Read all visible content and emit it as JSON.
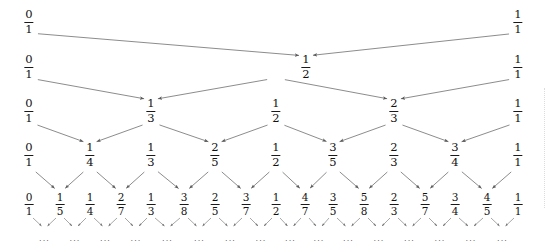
{
  "figure": {
    "width": 546,
    "height": 252,
    "background_color": "#ffffff",
    "text_color": "#111111",
    "arrow_color": "#555555"
  },
  "chart_data": {
    "type": "diagram",
    "subtype": "stern-brocot-mediant-tree",
    "rows": [
      {
        "level": 1,
        "y": 22,
        "fractions": [
          {
            "n": "0",
            "d": "1",
            "x": 29,
            "new": false
          },
          {
            "n": "1",
            "d": "1",
            "x": 518,
            "new": false
          }
        ]
      },
      {
        "level": 2,
        "y": 67,
        "fractions": [
          {
            "n": "0",
            "d": "1",
            "x": 29,
            "new": false
          },
          {
            "n": "1",
            "d": "2",
            "x": 306,
            "new": true
          },
          {
            "n": "1",
            "d": "1",
            "x": 518,
            "new": false
          }
        ]
      },
      {
        "level": 3,
        "y": 111,
        "fractions": [
          {
            "n": "0",
            "d": "1",
            "x": 29,
            "new": false
          },
          {
            "n": "1",
            "d": "3",
            "x": 151,
            "new": true
          },
          {
            "n": "1",
            "d": "2",
            "x": 276,
            "new": false
          },
          {
            "n": "2",
            "d": "3",
            "x": 394,
            "new": true
          },
          {
            "n": "1",
            "d": "1",
            "x": 518,
            "new": false
          }
        ]
      },
      {
        "level": 4,
        "y": 155,
        "fractions": [
          {
            "n": "0",
            "d": "1",
            "x": 29,
            "new": false
          },
          {
            "n": "1",
            "d": "4",
            "x": 90,
            "new": true
          },
          {
            "n": "1",
            "d": "3",
            "x": 151,
            "new": false
          },
          {
            "n": "2",
            "d": "5",
            "x": 215,
            "new": true
          },
          {
            "n": "1",
            "d": "2",
            "x": 276,
            "new": false
          },
          {
            "n": "3",
            "d": "5",
            "x": 333,
            "new": true
          },
          {
            "n": "2",
            "d": "3",
            "x": 394,
            "new": false
          },
          {
            "n": "3",
            "d": "4",
            "x": 455,
            "new": true
          },
          {
            "n": "1",
            "d": "1",
            "x": 518,
            "new": false
          }
        ]
      },
      {
        "level": 5,
        "y": 204,
        "fractions": [
          {
            "n": "0",
            "d": "1",
            "x": 29,
            "new": false
          },
          {
            "n": "1",
            "d": "5",
            "x": 60,
            "new": true
          },
          {
            "n": "1",
            "d": "4",
            "x": 90,
            "new": false
          },
          {
            "n": "2",
            "d": "7",
            "x": 121,
            "new": true
          },
          {
            "n": "1",
            "d": "3",
            "x": 151,
            "new": false
          },
          {
            "n": "3",
            "d": "8",
            "x": 184,
            "new": true
          },
          {
            "n": "2",
            "d": "5",
            "x": 215,
            "new": false
          },
          {
            "n": "3",
            "d": "7",
            "x": 246,
            "new": true
          },
          {
            "n": "1",
            "d": "2",
            "x": 276,
            "new": false
          },
          {
            "n": "4",
            "d": "7",
            "x": 305,
            "new": true
          },
          {
            "n": "3",
            "d": "5",
            "x": 333,
            "new": false
          },
          {
            "n": "5",
            "d": "8",
            "x": 364,
            "new": true
          },
          {
            "n": "2",
            "d": "3",
            "x": 394,
            "new": false
          },
          {
            "n": "5",
            "d": "7",
            "x": 425,
            "new": true
          },
          {
            "n": "3",
            "d": "4",
            "x": 455,
            "new": false
          },
          {
            "n": "4",
            "d": "5",
            "x": 487,
            "new": true
          },
          {
            "n": "1",
            "d": "1",
            "x": 518,
            "new": false
          }
        ]
      }
    ],
    "continuation": {
      "label": "...",
      "y": 232,
      "marker": "pair-of-small-arrows-above-ellipsis",
      "x_positions": [
        45,
        75,
        106,
        136,
        167,
        200,
        230,
        261,
        291,
        319,
        349,
        379,
        410,
        440,
        471,
        502
      ]
    },
    "edges_note": "Each new mediant at level k receives one arrow from its left parent and one from its right parent in level k-1."
  }
}
